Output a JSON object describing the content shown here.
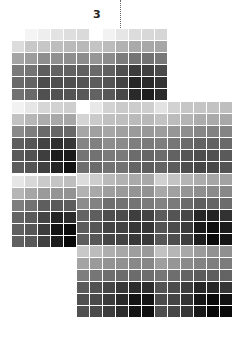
{
  "label": "3",
  "blocks": [
    {
      "name": "top-block",
      "left": 12,
      "top": 29,
      "cols": 12,
      "rows": [
        [
          null,
          "#f4f4f4",
          "#eeeeee",
          "#e3e3e3",
          "#dedede",
          "#dadada",
          null,
          "#f2f2f2",
          "#e6e6e6",
          "#dcdcdc",
          "#d8d8d8",
          "#d6d6d6"
        ],
        [
          "#dcdcdc",
          "#c8c8c8",
          "#c6c6c6",
          "#bebebe",
          "#bababa",
          "#b8b8b8",
          "#c4c4c4",
          "#bcbcbc",
          "#b2b2b2",
          "#aaaaaa",
          "#a8a8a8",
          "#a6a6a6"
        ],
        [
          "#a4a4a4",
          "#9c9c9c",
          "#8e8e8e",
          "#909090",
          "#8e8e8e",
          "#8c8c8c",
          "#969696",
          "#8c8c8c",
          "#7c7c7c",
          "#747474",
          "#727272",
          "#787878"
        ],
        [
          "#7a7a7a",
          "#747474",
          "#5e5e5e",
          "#626262",
          "#626262",
          "#606060",
          "#6a6a6a",
          "#606060",
          "#505050",
          "#3c3c3c",
          "#404040",
          "#4a4a4a"
        ],
        [
          "#6a6a6a",
          "#646464",
          "#4c4c4c",
          "#4e4e4e",
          "#505050",
          "#545454",
          "#5c5c5c",
          "#545454",
          "#444444",
          "#262626",
          "#2a2a2a",
          "#343434"
        ],
        [
          "#727272",
          "#6a6a6a",
          "#505050",
          "#525252",
          "#545454",
          "#585858",
          "#626262",
          "#585858",
          "#484848",
          "#2a2a2a",
          "#1e1e1e",
          "#2c2c2c"
        ]
      ]
    },
    {
      "name": "middle-left-block",
      "left": 12,
      "top": 102,
      "cols": 5,
      "rows": [
        [
          "#f2f2f2",
          "#e6e6e6",
          "#d6d6d6",
          "#d2d2d2",
          "#cecece"
        ],
        [
          "#c2c2c2",
          "#b6b6b6",
          "#acacac",
          "#a8a8a8",
          "#a6a6a6"
        ],
        [
          "#8a8a8a",
          "#7e7e7e",
          "#6a6a6a",
          "#666666",
          "#686868"
        ],
        [
          "#5e5e5e",
          "#565656",
          "#444444",
          "#2e2e2e",
          "#363636"
        ],
        [
          "#5a5a5a",
          "#525252",
          "#3e3e3e",
          "#1c1c1c",
          "#1a1a1a"
        ],
        [
          "#5c5c5c",
          "#545454",
          "#404040",
          "#242424",
          "#121212"
        ]
      ]
    },
    {
      "name": "lower-left-block",
      "left": 12,
      "top": 176,
      "cols": 5,
      "rows": [
        [
          "#e6e6e6",
          "#d8d8d8",
          "#cacaca",
          "#c4c4c4",
          "#bebebe"
        ],
        [
          "#b6b6b6",
          "#a6a6a6",
          "#9a9a9a",
          "#949494",
          "#929292"
        ],
        [
          "#7e7e7e",
          "#727272",
          "#5e5e5e",
          "#5a5a5a",
          "#5c5c5c"
        ],
        [
          "#646464",
          "#5a5a5a",
          "#444444",
          "#242424",
          "#2c2c2c"
        ],
        [
          "#606060",
          "#565656",
          "#3c3c3c",
          "#141414",
          "#0c0c0c"
        ],
        [
          "#606060",
          "#585858",
          "#404040",
          "#1c1c1c",
          "#080808"
        ]
      ]
    },
    {
      "name": "right-block",
      "left": 77,
      "top": 102,
      "cols": 12,
      "rows": [
        [
          "#ffffff",
          "#e8e8e8",
          "#d2d2d2",
          "#cacaca",
          "#cccccc",
          "#cecece",
          "#e2e2e2",
          "#d2d2d2",
          "#c6c6c6",
          "#c4c4c4",
          "#c2c2c2",
          "#bebebe"
        ],
        [
          "#d4d4d4",
          "#cacaca",
          "#c0c0c0",
          "#bebebe",
          "#bababa",
          "#b8b8b8",
          "#c2c2c2",
          "#bcbcbc",
          "#b4b4b4",
          "#acacac",
          "#aaaaaa",
          "#a8a8a8"
        ],
        [
          "#a6a6a6",
          "#a0a0a0",
          "#a6a6a6",
          "#a0a0a0",
          "#9a9a9a",
          "#989898",
          "#9c9c9c",
          "#969696",
          "#8e8e8e",
          "#868686",
          "#828282",
          "#848484"
        ],
        [
          "#848484",
          "#808080",
          "#8c8c8c",
          "#8a8a8a",
          "#7e7e7e",
          "#7a7a7a",
          "#7e7e7e",
          "#767676",
          "#6a6a6a",
          "#626262",
          "#626262",
          "#6a6a6a"
        ],
        [
          "#747474",
          "#727272",
          "#7a7a7a",
          "#7a7a7a",
          "#6c6c6c",
          "#666666",
          "#6c6c6c",
          "#626262",
          "#565656",
          "#4e4e4e",
          "#505050",
          "#5a5a5a"
        ],
        [
          "#6e6e6e",
          "#6c6c6c",
          "#727272",
          "#727272",
          "#646464",
          "#5e5e5e",
          "#646464",
          "#5c5c5c",
          "#4e4e4e",
          "#464646",
          "#484848",
          "#545454"
        ],
        [
          "#dcdcdc",
          "#cdcdcd",
          "#bababa",
          "#b2b2b2",
          "#aaaaaa",
          "#a8a8a8",
          "#d0d0d0",
          "#c4c4c4",
          "#b4b4b4",
          "#acacac",
          "#a6a6a6",
          "#a2a2a2"
        ],
        [
          "#b2b2b2",
          "#a8a8a8",
          "#9e9e9e",
          "#9a9a9a",
          "#949494",
          "#929292",
          "#a8a8a8",
          "#a0a0a0",
          "#949494",
          "#8e8e8e",
          "#8a8a8a",
          "#888888"
        ],
        [
          "#8c8c8c",
          "#828282",
          "#6e6e6e",
          "#727272",
          "#747474",
          "#7a7a7a",
          "#828282",
          "#7a7a7a",
          "#6a6a6a",
          "#5e5e5e",
          "#646464",
          "#6c6c6c"
        ],
        [
          "#646464",
          "#5e5e5e",
          "#4e4e4e",
          "#4c4c4c",
          "#3e3e3e",
          "#444444",
          "#5c5c5c",
          "#545454",
          "#464646",
          "#262626",
          "#242424",
          "#323232"
        ],
        [
          "#5c5c5c",
          "#565656",
          "#444444",
          "#424242",
          "#363636",
          "#363636",
          "#545454",
          "#4c4c4c",
          "#3c3c3c",
          "#1a1a1a",
          "#0e0e0e",
          "#1c1c1c"
        ],
        [
          "#5e5e5e",
          "#585858",
          "#464646",
          "#444444",
          "#383838",
          "#383838",
          "#565656",
          "#4e4e4e",
          "#3e3e3e",
          "#1e1e1e",
          "#0a0a0a",
          "#161616"
        ],
        [
          "#c8c8c8",
          "#bcbcbc",
          "#aeaeae",
          "#a8a8a8",
          "#9e9e9e",
          "#9a9a9a",
          "#c2c2c2",
          "#b6b6b6",
          "#a8a8a8",
          "#9c9c9c",
          "#929292",
          "#909090"
        ],
        [
          "#a4a4a4",
          "#9a9a9a",
          "#929292",
          "#909090",
          "#888888",
          "#868686",
          "#9e9e9e",
          "#969696",
          "#8a8a8a",
          "#828282",
          "#7e7e7e",
          "#7c7c7c"
        ],
        [
          "#7e7e7e",
          "#767676",
          "#6e6e6e",
          "#6c6c6c",
          "#6c6c6c",
          "#6e6e6e",
          "#767676",
          "#6e6e6e",
          "#646464",
          "#5c5c5c",
          "#5e5e5e",
          "#646464"
        ],
        [
          "#5a5a5a",
          "#525252",
          "#464646",
          "#383838",
          "#2c2c2c",
          "#2e2e2e",
          "#545454",
          "#4c4c4c",
          "#3e3e3e",
          "#262626",
          "#262626",
          "#363636"
        ],
        [
          "#505050",
          "#4a4a4a",
          "#3c3c3c",
          "#2a2a2a",
          "#141414",
          "#141414",
          "#4c4c4c",
          "#444444",
          "#343434",
          "#161616",
          "#0a0a0a",
          "#121212"
        ],
        [
          "#505050",
          "#4a4a4a",
          "#3c3c3c",
          "#2c2c2c",
          "#141414",
          "#0e0e0e",
          "#4e4e4e",
          "#464646",
          "#363636",
          "#181818",
          "#080808",
          "#0a0a0a"
        ]
      ]
    }
  ]
}
